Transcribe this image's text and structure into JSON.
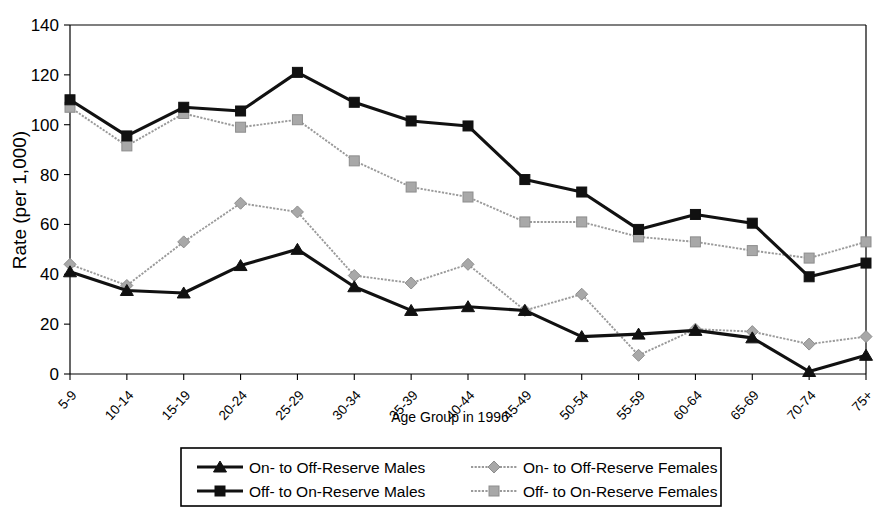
{
  "chart_data": {
    "type": "line",
    "title": "",
    "xlabel": "Age Group in 1996",
    "ylabel": "Rate (per 1,000)",
    "ylim": [
      0,
      140
    ],
    "yticks": [
      0,
      20,
      40,
      60,
      80,
      100,
      120,
      140
    ],
    "grid": false,
    "legend_position": "bottom",
    "categories": [
      "5-9",
      "10-14",
      "15-19",
      "20-24",
      "25-29",
      "30-34",
      "35-39",
      "40-44",
      "45-49",
      "50-54",
      "55-59",
      "60-64",
      "65-69",
      "70-74",
      "75+"
    ],
    "series": [
      {
        "name": "On- to Off-Reserve Males",
        "marker": "triangle",
        "color": "#111111",
        "style": "solid-thick",
        "values": [
          41,
          33.5,
          32.5,
          43.5,
          50,
          35,
          25.5,
          27,
          25.5,
          15,
          16,
          17.5,
          14.5,
          1,
          7.5
        ]
      },
      {
        "name": "Off- to On-Reserve Males",
        "marker": "square",
        "color": "#111111",
        "style": "solid-thick",
        "values": [
          110,
          95.5,
          107,
          105.5,
          121,
          109,
          101.5,
          99.5,
          78,
          73,
          58,
          64,
          60.5,
          39,
          44.5
        ]
      },
      {
        "name": "On- to Off-Reserve Females",
        "marker": "diamond",
        "color": "#a8a8a8",
        "style": "dotted-thin",
        "values": [
          44,
          35.5,
          53,
          68.5,
          65,
          39.5,
          36.5,
          44,
          25.5,
          32,
          7.5,
          18,
          17,
          12,
          15
        ]
      },
      {
        "name": "Off- to On-Reserve Females",
        "marker": "square",
        "color": "#a8a8a8",
        "style": "dotted-thin",
        "values": [
          107,
          91.5,
          104.5,
          99,
          102,
          85.5,
          75,
          71,
          61,
          61,
          55,
          53,
          49.5,
          46.5,
          53
        ]
      }
    ]
  },
  "legend": {
    "entries": [
      {
        "label": "On- to Off-Reserve Males",
        "marker": "triangle",
        "color": "#111111"
      },
      {
        "label": "Off- to On-Reserve Males",
        "marker": "square",
        "color": "#111111"
      },
      {
        "label": "On- to Off-Reserve Females",
        "marker": "diamond",
        "color": "#a8a8a8"
      },
      {
        "label": "Off- to On-Reserve Females",
        "marker": "square",
        "color": "#a8a8a8"
      }
    ]
  }
}
